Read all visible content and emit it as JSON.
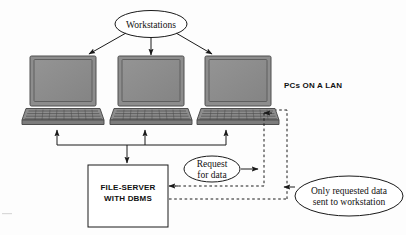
{
  "diagram": {
    "title_node": {
      "label": "Workstations"
    },
    "lan_label": {
      "label": "PCs ON A LAN"
    },
    "server_box": {
      "line1": "FILE-SERVER",
      "line2": "WITH DBMS"
    },
    "request_node": {
      "line1": "Request",
      "line2": "for data"
    },
    "response_node": {
      "line1": "Only requested data",
      "line2": "sent to workstation"
    },
    "workstations": [
      {
        "name": "workstation-1"
      },
      {
        "name": "workstation-2"
      },
      {
        "name": "workstation-3"
      }
    ],
    "colors": {
      "stroke": "#1a1a1a",
      "screen_fill": "#8d8d8d",
      "screen_border": "#5c5c5c",
      "body_fill": "#8d8d8d",
      "body_dark": "#6e6e6e",
      "key_line": "#4a4a4a",
      "page_bg": "#fdfdfd",
      "node_fill": "#ffffff"
    }
  }
}
